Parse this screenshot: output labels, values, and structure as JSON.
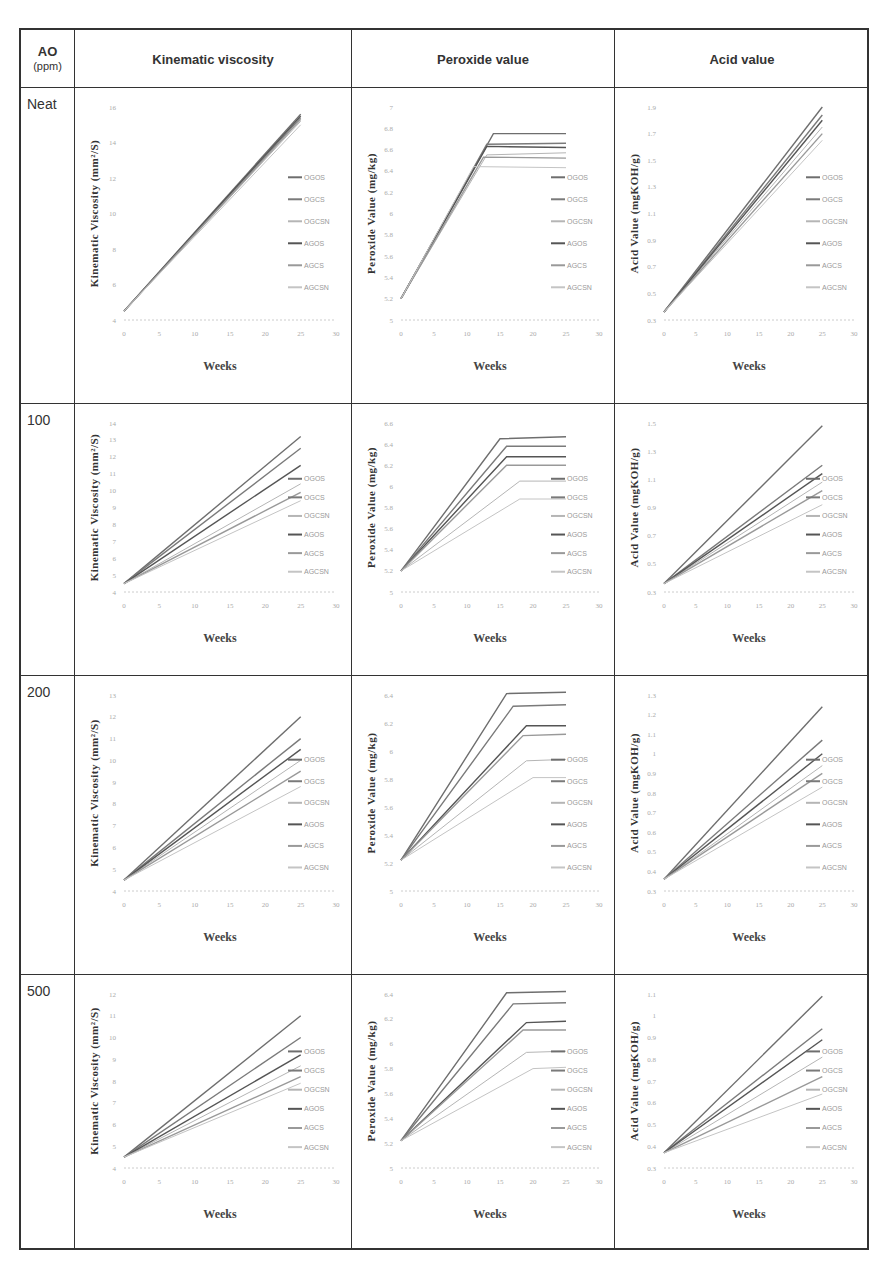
{
  "table": {
    "header": {
      "ao_label": "AO",
      "ao_unit": "(ppm)",
      "columns": [
        "Kinematic viscosity",
        "Peroxide value",
        "Acid value"
      ]
    },
    "rows": [
      "Neat",
      "100",
      "200",
      "500"
    ]
  },
  "legend": [
    "OGOS",
    "OGCS",
    "OGCSN",
    "AGOS",
    "AGCS",
    "AGCSN"
  ],
  "series_colors": [
    "#6e6e6e",
    "#7a7a7a",
    "#b5b5b5",
    "#555555",
    "#999999",
    "#c4c4c4"
  ],
  "chart_data": [
    {
      "type": "line",
      "row": "Neat",
      "column": "Kinematic viscosity",
      "xlabel": "Weeks",
      "ylabel": "Kinematic Viscosity (mm²/S)",
      "xlim": [
        0,
        30
      ],
      "xticks": [
        0,
        5,
        10,
        15,
        20,
        25,
        30
      ],
      "ylim": [
        4,
        16
      ],
      "yticks": [
        4,
        6,
        8,
        10,
        12,
        14,
        16
      ],
      "x": [
        0,
        25
      ],
      "series": [
        {
          "name": "OGOS",
          "values": [
            4.5,
            15.6
          ]
        },
        {
          "name": "OGCS",
          "values": [
            4.5,
            15.4
          ]
        },
        {
          "name": "OGCSN",
          "values": [
            4.5,
            15.2
          ]
        },
        {
          "name": "AGOS",
          "values": [
            4.5,
            15.5
          ]
        },
        {
          "name": "AGCS",
          "values": [
            4.5,
            15.3
          ]
        },
        {
          "name": "AGCSN",
          "values": [
            4.5,
            15.0
          ]
        }
      ]
    },
    {
      "type": "line",
      "row": "Neat",
      "column": "Peroxide value",
      "xlabel": "Weeks",
      "ylabel": "Peroxide Value (mg/kg)",
      "xlim": [
        0,
        30
      ],
      "xticks": [
        0,
        5,
        10,
        15,
        20,
        25,
        30
      ],
      "ylim": [
        5,
        7
      ],
      "yticks": [
        5,
        5.2,
        5.4,
        5.6,
        5.8,
        6,
        6.2,
        6.4,
        6.6,
        6.8,
        7
      ],
      "x": [
        0,
        14,
        25
      ],
      "series": [
        {
          "name": "OGOS",
          "x": [
            0,
            14,
            25
          ],
          "values": [
            5.2,
            6.75,
            6.75
          ]
        },
        {
          "name": "OGCS",
          "x": [
            0,
            13,
            25
          ],
          "values": [
            5.2,
            6.65,
            6.66
          ]
        },
        {
          "name": "OGCSN",
          "x": [
            0,
            13,
            25
          ],
          "values": [
            5.2,
            6.55,
            6.57
          ]
        },
        {
          "name": "AGOS",
          "x": [
            0,
            13,
            25
          ],
          "values": [
            5.2,
            6.63,
            6.62
          ]
        },
        {
          "name": "AGCS",
          "x": [
            0,
            12.5,
            25
          ],
          "values": [
            5.2,
            6.53,
            6.52
          ]
        },
        {
          "name": "AGCSN",
          "x": [
            0,
            11,
            25
          ],
          "values": [
            5.2,
            6.44,
            6.43
          ]
        }
      ]
    },
    {
      "type": "line",
      "row": "Neat",
      "column": "Acid value",
      "xlabel": "Weeks",
      "ylabel": "Acid Value (mgKOH/g)",
      "xlim": [
        0,
        30
      ],
      "xticks": [
        0,
        5,
        10,
        15,
        20,
        25,
        30
      ],
      "ylim": [
        0.3,
        1.9
      ],
      "yticks": [
        0.3,
        0.5,
        0.7,
        0.9,
        1.1,
        1.3,
        1.5,
        1.7,
        1.9
      ],
      "x": [
        0,
        25
      ],
      "series": [
        {
          "name": "OGOS",
          "values": [
            0.36,
            1.9
          ]
        },
        {
          "name": "OGCS",
          "values": [
            0.36,
            1.84
          ]
        },
        {
          "name": "OGCSN",
          "values": [
            0.36,
            1.75
          ]
        },
        {
          "name": "AGOS",
          "values": [
            0.36,
            1.8
          ]
        },
        {
          "name": "AGCS",
          "values": [
            0.36,
            1.7
          ]
        },
        {
          "name": "AGCSN",
          "values": [
            0.36,
            1.65
          ]
        }
      ]
    },
    {
      "type": "line",
      "row": "100",
      "column": "Kinematic viscosity",
      "xlabel": "Weeks",
      "ylabel": "Kinematic Viscosity (mm²/S)",
      "xlim": [
        0,
        30
      ],
      "xticks": [
        0,
        5,
        10,
        15,
        20,
        25,
        30
      ],
      "ylim": [
        4,
        14
      ],
      "yticks": [
        4,
        5,
        6,
        7,
        8,
        9,
        10,
        11,
        12,
        13,
        14
      ],
      "x": [
        0,
        25
      ],
      "series": [
        {
          "name": "OGOS",
          "values": [
            4.5,
            13.2
          ]
        },
        {
          "name": "OGCS",
          "values": [
            4.5,
            12.5
          ]
        },
        {
          "name": "OGCSN",
          "values": [
            4.5,
            10.4
          ]
        },
        {
          "name": "AGOS",
          "values": [
            4.5,
            11.5
          ]
        },
        {
          "name": "AGCS",
          "values": [
            4.5,
            9.9
          ]
        },
        {
          "name": "AGCSN",
          "values": [
            4.5,
            9.4
          ]
        }
      ]
    },
    {
      "type": "line",
      "row": "100",
      "column": "Peroxide value",
      "xlabel": "Weeks",
      "ylabel": "Peroxide Value (mg/kg)",
      "xlim": [
        0,
        30
      ],
      "xticks": [
        0,
        5,
        10,
        15,
        20,
        25,
        30
      ],
      "ylim": [
        5,
        6.6
      ],
      "yticks": [
        5,
        5.2,
        5.4,
        5.6,
        5.8,
        6,
        6.2,
        6.4,
        6.6
      ],
      "series": [
        {
          "name": "OGOS",
          "x": [
            0,
            15,
            25
          ],
          "values": [
            5.2,
            6.45,
            6.47
          ]
        },
        {
          "name": "OGCS",
          "x": [
            0,
            16,
            25
          ],
          "values": [
            5.2,
            6.38,
            6.38
          ]
        },
        {
          "name": "OGCSN",
          "x": [
            0,
            18,
            25
          ],
          "values": [
            5.2,
            6.05,
            6.05
          ]
        },
        {
          "name": "AGOS",
          "x": [
            0,
            16,
            25
          ],
          "values": [
            5.2,
            6.28,
            6.28
          ]
        },
        {
          "name": "AGCS",
          "x": [
            0,
            16,
            25
          ],
          "values": [
            5.2,
            6.2,
            6.2
          ]
        },
        {
          "name": "AGCSN",
          "x": [
            0,
            18,
            25
          ],
          "values": [
            5.2,
            5.88,
            5.88
          ]
        }
      ]
    },
    {
      "type": "line",
      "row": "100",
      "column": "Acid value",
      "xlabel": "Weeks",
      "ylabel": "Acid Value (mgKOH/g)",
      "xlim": [
        0,
        30
      ],
      "xticks": [
        0,
        5,
        10,
        15,
        20,
        25,
        30
      ],
      "ylim": [
        0.3,
        1.5
      ],
      "yticks": [
        0.3,
        0.5,
        0.7,
        0.9,
        1.1,
        1.3,
        1.5
      ],
      "x": [
        0,
        25
      ],
      "series": [
        {
          "name": "OGOS",
          "values": [
            0.36,
            1.48
          ]
        },
        {
          "name": "OGCS",
          "values": [
            0.36,
            1.2
          ]
        },
        {
          "name": "OGCSN",
          "values": [
            0.36,
            1.08
          ]
        },
        {
          "name": "AGOS",
          "values": [
            0.36,
            1.14
          ]
        },
        {
          "name": "AGCS",
          "values": [
            0.36,
            1.02
          ]
        },
        {
          "name": "AGCSN",
          "values": [
            0.36,
            0.92
          ]
        }
      ]
    },
    {
      "type": "line",
      "row": "200",
      "column": "Kinematic viscosity",
      "xlabel": "Weeks",
      "ylabel": "Kinematic Viscosity (mm²/S)",
      "xlim": [
        0,
        30
      ],
      "xticks": [
        0,
        5,
        10,
        15,
        20,
        25,
        30
      ],
      "ylim": [
        4,
        13
      ],
      "yticks": [
        4,
        5,
        6,
        7,
        8,
        9,
        10,
        11,
        12,
        13
      ],
      "x": [
        0,
        25
      ],
      "series": [
        {
          "name": "OGOS",
          "values": [
            4.5,
            12.0
          ]
        },
        {
          "name": "OGCS",
          "values": [
            4.5,
            11.0
          ]
        },
        {
          "name": "OGCSN",
          "values": [
            4.5,
            10.0
          ]
        },
        {
          "name": "AGOS",
          "values": [
            4.5,
            10.5
          ]
        },
        {
          "name": "AGCS",
          "values": [
            4.5,
            9.5
          ]
        },
        {
          "name": "AGCSN",
          "values": [
            4.5,
            8.8
          ]
        }
      ]
    },
    {
      "type": "line",
      "row": "200",
      "column": "Peroxide value",
      "xlabel": "Weeks",
      "ylabel": "Peroxide Value (mg/kg)",
      "xlim": [
        0,
        30
      ],
      "xticks": [
        0,
        5,
        10,
        15,
        20,
        25,
        30
      ],
      "ylim": [
        5,
        6.4
      ],
      "yticks": [
        5,
        5.2,
        5.4,
        5.6,
        5.8,
        6,
        6.2,
        6.4
      ],
      "series": [
        {
          "name": "OGOS",
          "x": [
            0,
            16,
            25
          ],
          "values": [
            5.22,
            6.41,
            6.42
          ]
        },
        {
          "name": "OGCS",
          "x": [
            0,
            17,
            25
          ],
          "values": [
            5.22,
            6.32,
            6.33
          ]
        },
        {
          "name": "OGCSN",
          "x": [
            0,
            19,
            25
          ],
          "values": [
            5.22,
            5.93,
            5.94
          ]
        },
        {
          "name": "AGOS",
          "x": [
            0,
            19,
            25
          ],
          "values": [
            5.22,
            6.18,
            6.18
          ]
        },
        {
          "name": "AGCS",
          "x": [
            0,
            18.5,
            25
          ],
          "values": [
            5.22,
            6.11,
            6.12
          ]
        },
        {
          "name": "AGCSN",
          "x": [
            0,
            20,
            25
          ],
          "values": [
            5.22,
            5.81,
            5.81
          ]
        }
      ]
    },
    {
      "type": "line",
      "row": "200",
      "column": "Acid value",
      "xlabel": "Weeks",
      "ylabel": "Acid Value (mgKOH/g)",
      "xlim": [
        0,
        30
      ],
      "xticks": [
        0,
        5,
        10,
        15,
        20,
        25,
        30
      ],
      "ylim": [
        0.3,
        1.3
      ],
      "yticks": [
        0.3,
        0.4,
        0.5,
        0.6,
        0.7,
        0.8,
        0.9,
        1,
        1.1,
        1.2,
        1.3
      ],
      "x": [
        0,
        25
      ],
      "series": [
        {
          "name": "OGOS",
          "values": [
            0.36,
            1.24
          ]
        },
        {
          "name": "OGCS",
          "values": [
            0.36,
            1.07
          ]
        },
        {
          "name": "OGCSN",
          "values": [
            0.36,
            0.94
          ]
        },
        {
          "name": "AGOS",
          "values": [
            0.36,
            1.0
          ]
        },
        {
          "name": "AGCS",
          "values": [
            0.36,
            0.9
          ]
        },
        {
          "name": "AGCSN",
          "values": [
            0.36,
            0.83
          ]
        }
      ]
    },
    {
      "type": "line",
      "row": "500",
      "column": "Kinematic viscosity",
      "xlabel": "Weeks",
      "ylabel": "Kinematic Viscosity (mm²/S)",
      "xlim": [
        0,
        30
      ],
      "xticks": [
        0,
        5,
        10,
        15,
        20,
        25,
        30
      ],
      "ylim": [
        4,
        12
      ],
      "yticks": [
        4,
        5,
        6,
        7,
        8,
        9,
        10,
        11,
        12
      ],
      "x": [
        0,
        25
      ],
      "series": [
        {
          "name": "OGOS",
          "values": [
            4.5,
            11.0
          ]
        },
        {
          "name": "OGCS",
          "values": [
            4.5,
            10.0
          ]
        },
        {
          "name": "OGCSN",
          "values": [
            4.5,
            8.7
          ]
        },
        {
          "name": "AGOS",
          "values": [
            4.5,
            9.2
          ]
        },
        {
          "name": "AGCS",
          "values": [
            4.5,
            8.2
          ]
        },
        {
          "name": "AGCSN",
          "values": [
            4.5,
            7.9
          ]
        }
      ]
    },
    {
      "type": "line",
      "row": "500",
      "column": "Peroxide value",
      "xlabel": "Weeks",
      "ylabel": "Peroxide Value (mg/kg)",
      "xlim": [
        0,
        30
      ],
      "xticks": [
        0,
        5,
        10,
        15,
        20,
        25,
        30
      ],
      "ylim": [
        5,
        6.4
      ],
      "yticks": [
        5,
        5.2,
        5.4,
        5.6,
        5.8,
        6,
        6.2,
        6.4
      ],
      "series": [
        {
          "name": "OGOS",
          "x": [
            0,
            16,
            25
          ],
          "values": [
            5.22,
            6.41,
            6.42
          ]
        },
        {
          "name": "OGCS",
          "x": [
            0,
            17,
            25
          ],
          "values": [
            5.22,
            6.32,
            6.33
          ]
        },
        {
          "name": "OGCSN",
          "x": [
            0,
            19,
            25
          ],
          "values": [
            5.22,
            5.93,
            5.94
          ]
        },
        {
          "name": "AGOS",
          "x": [
            0,
            19,
            25
          ],
          "values": [
            5.22,
            6.17,
            6.18
          ]
        },
        {
          "name": "AGCS",
          "x": [
            0,
            18.5,
            25
          ],
          "values": [
            5.22,
            6.11,
            6.11
          ]
        },
        {
          "name": "AGCSN",
          "x": [
            0,
            20,
            25
          ],
          "values": [
            5.22,
            5.8,
            5.81
          ]
        }
      ]
    },
    {
      "type": "line",
      "row": "500",
      "column": "Acid value",
      "xlabel": "Weeks",
      "ylabel": "Acid Value (mgKOH/g)",
      "xlim": [
        0,
        30
      ],
      "xticks": [
        0,
        5,
        10,
        15,
        20,
        25,
        30
      ],
      "ylim": [
        0.3,
        1.1
      ],
      "yticks": [
        0.3,
        0.4,
        0.5,
        0.6,
        0.7,
        0.8,
        0.9,
        1,
        1.1
      ],
      "x": [
        0,
        25
      ],
      "series": [
        {
          "name": "OGOS",
          "values": [
            0.37,
            1.09
          ]
        },
        {
          "name": "OGCS",
          "values": [
            0.37,
            0.94
          ]
        },
        {
          "name": "OGCSN",
          "values": [
            0.37,
            0.81
          ]
        },
        {
          "name": "AGOS",
          "values": [
            0.37,
            0.89
          ]
        },
        {
          "name": "AGCS",
          "values": [
            0.37,
            0.72
          ]
        },
        {
          "name": "AGCSN",
          "values": [
            0.37,
            0.64
          ]
        }
      ]
    }
  ]
}
